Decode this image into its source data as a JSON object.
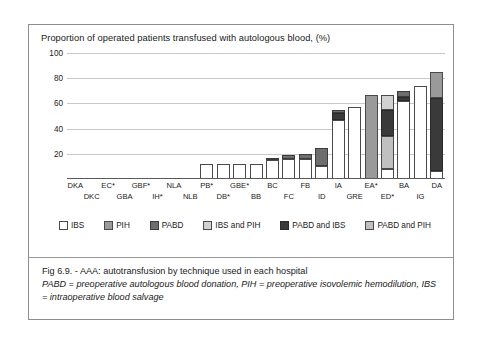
{
  "figure": {
    "caption_line1": "Fig 6.9. - AAA:  autotransfusion by technique used in each hospital",
    "caption_line2": "PABD = preoperative autologous blood donation, PIH = preoperative isovolemic hemodilution, IBS = intraoperative blood salvage"
  },
  "legend": {
    "items": [
      {
        "label": "IBS",
        "color": "#ffffff"
      },
      {
        "label": "PIH",
        "color": "#9a9a9a"
      },
      {
        "label": "PABD",
        "color": "#6e6e6e"
      },
      {
        "label": "IBS and PIH",
        "color": "#d2d2d2"
      },
      {
        "label": "PABD and IBS",
        "color": "#3a3a3a"
      },
      {
        "label": "PABD and PIH",
        "color": "#c0c0c0"
      }
    ]
  },
  "axis": {
    "yticks": [
      "100",
      "80",
      "60",
      "40",
      "20"
    ]
  },
  "xlabels": [
    {
      "top": "DKA",
      "bottom": ""
    },
    {
      "top": "",
      "bottom": "DKC"
    },
    {
      "top": "EC*",
      "bottom": ""
    },
    {
      "top": "",
      "bottom": "GBA"
    },
    {
      "top": "GBF*",
      "bottom": ""
    },
    {
      "top": "",
      "bottom": "IH*"
    },
    {
      "top": "NLA",
      "bottom": ""
    },
    {
      "top": "",
      "bottom": "NLB"
    },
    {
      "top": "PB*",
      "bottom": ""
    },
    {
      "top": "",
      "bottom": "DB*"
    },
    {
      "top": "GBE*",
      "bottom": ""
    },
    {
      "top": "",
      "bottom": "BB"
    },
    {
      "top": "BC",
      "bottom": ""
    },
    {
      "top": "",
      "bottom": "FC"
    },
    {
      "top": "FB",
      "bottom": ""
    },
    {
      "top": "",
      "bottom": "ID"
    },
    {
      "top": "IA",
      "bottom": ""
    },
    {
      "top": "",
      "bottom": "GRE"
    },
    {
      "top": "EA*",
      "bottom": ""
    },
    {
      "top": "",
      "bottom": "ED*"
    },
    {
      "top": "BA",
      "bottom": ""
    },
    {
      "top": "",
      "bottom": "IG"
    },
    {
      "top": "DA",
      "bottom": ""
    }
  ],
  "chart_data": {
    "type": "bar",
    "title": "Proportion of operated patients transfused with autologous blood, (%)",
    "xlabel": "",
    "ylabel": "",
    "ylim": [
      0,
      100
    ],
    "yticks": [
      20,
      40,
      60,
      80,
      100
    ],
    "grid": true,
    "stacked": true,
    "legend_position": "below-plot",
    "categories": [
      "DKA",
      "DKC",
      "EC*",
      "GBA",
      "GBF*",
      "IH*",
      "NLA",
      "NLB",
      "PB*",
      "DB*",
      "GBE*",
      "BB",
      "BC",
      "FC",
      "FB",
      "ID",
      "IA",
      "GRE",
      "EA*",
      "ED*",
      "BA",
      "IG",
      "DA"
    ],
    "series": [
      {
        "name": "IBS",
        "values": [
          0,
          0,
          0,
          0,
          0,
          0,
          0,
          0,
          12,
          12,
          12,
          12,
          15,
          16,
          16,
          10,
          47,
          57,
          0,
          8,
          62,
          74,
          6
        ]
      },
      {
        "name": "PIH",
        "values": [
          0,
          0,
          0,
          0,
          0,
          0,
          0,
          0,
          0,
          0,
          0,
          0,
          0,
          0,
          0,
          0,
          0,
          0,
          67,
          0,
          0,
          0,
          21
        ]
      },
      {
        "name": "PABD",
        "values": [
          0,
          0,
          0,
          0,
          0,
          0,
          0,
          0,
          0,
          0,
          0,
          0,
          2,
          3,
          4,
          15,
          3,
          0,
          0,
          0,
          5,
          0,
          0
        ]
      },
      {
        "name": "IBS and PIH",
        "values": [
          0,
          0,
          0,
          0,
          0,
          0,
          0,
          0,
          0,
          0,
          0,
          0,
          0,
          0,
          0,
          0,
          0,
          0,
          0,
          12,
          0,
          0,
          0
        ]
      },
      {
        "name": "PABD and IBS",
        "values": [
          0,
          0,
          0,
          0,
          0,
          0,
          0,
          0,
          0,
          0,
          0,
          0,
          0,
          0,
          0,
          0,
          5,
          0,
          0,
          21,
          3,
          0,
          58
        ]
      },
      {
        "name": "PABD and PIH",
        "values": [
          0,
          0,
          0,
          0,
          0,
          0,
          0,
          0,
          0,
          0,
          0,
          0,
          0,
          0,
          0,
          0,
          0,
          0,
          0,
          26,
          0,
          0,
          0
        ]
      }
    ]
  }
}
